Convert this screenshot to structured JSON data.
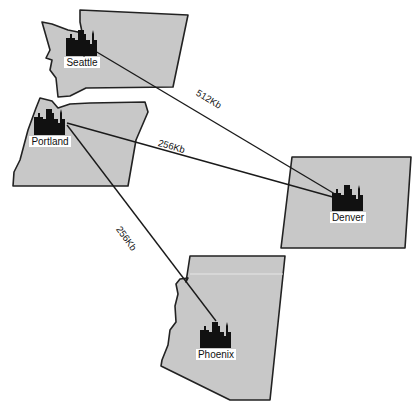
{
  "diagram": {
    "type": "wan-network-map",
    "colors": {
      "state_fill": "#c8c8c8",
      "outline": "#222222",
      "link": "#1a1a1a",
      "label_bg": "#ffffff"
    },
    "sites": [
      {
        "id": "seattle",
        "name": "Seattle",
        "state": "Washington",
        "icon": "city-skyline-icon"
      },
      {
        "id": "portland",
        "name": "Portland",
        "state": "Oregon",
        "icon": "city-skyline-icon"
      },
      {
        "id": "denver",
        "name": "Denver",
        "state": "Colorado",
        "icon": "city-skyline-icon"
      },
      {
        "id": "phoenix",
        "name": "Phoenix",
        "state": "Arizona",
        "icon": "city-skyline-icon"
      }
    ],
    "links": [
      {
        "from": "Seattle",
        "to": "Denver",
        "bandwidth": "512Kb"
      },
      {
        "from": "Portland",
        "to": "Denver",
        "bandwidth": "256Kb"
      },
      {
        "from": "Portland",
        "to": "Phoenix",
        "bandwidth": "256Kb"
      }
    ]
  }
}
